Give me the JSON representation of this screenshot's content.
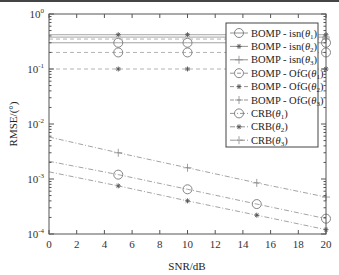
{
  "chart_data": {
    "type": "line",
    "title": "",
    "xlabel": "SNR/dB",
    "ylabel": "RMSE/(°)",
    "xlim": [
      0,
      20
    ],
    "ylim": [
      0.0001,
      1
    ],
    "yscale": "log",
    "grid": false,
    "legend_position": "upper right",
    "x_ticks": [
      0,
      2,
      4,
      6,
      8,
      10,
      12,
      14,
      16,
      18,
      20
    ],
    "y_ticks": [
      "10^0",
      "10^-1",
      "10^-2",
      "10^-3",
      "10^-4"
    ],
    "x": [
      0,
      5,
      10,
      15,
      20
    ],
    "series": [
      {
        "name": "BOMP - isn(θ1)",
        "marker": "circle",
        "linestyle": "solid",
        "values": [
          0.3,
          0.3,
          0.3,
          0.3,
          0.3
        ],
        "marker_x": [
          5,
          10,
          20
        ]
      },
      {
        "name": "BOMP - isn(θ2)",
        "marker": "star",
        "linestyle": "solid",
        "values": [
          0.42,
          0.42,
          0.42,
          0.42,
          0.42
        ],
        "marker_x": [
          5,
          10,
          20
        ]
      },
      {
        "name": "BOMP - isn(θ3)",
        "marker": "plus",
        "linestyle": "solid",
        "values": [
          0.38,
          0.38,
          0.38,
          0.38,
          0.38
        ],
        "marker_x": [
          20
        ]
      },
      {
        "name": "BOMP - OfG(θ1)",
        "marker": "circle",
        "linestyle": "dashed",
        "values": [
          0.2,
          0.2,
          0.2,
          0.2,
          0.2
        ],
        "marker_x": [
          5,
          10,
          20
        ]
      },
      {
        "name": "BOMP - OfG(θ2)",
        "marker": "star",
        "linestyle": "dashed",
        "values": [
          0.1,
          0.1,
          0.1,
          0.1,
          0.1
        ],
        "marker_x": [
          5,
          10,
          20
        ]
      },
      {
        "name": "BOMP - OfG(θ3)",
        "marker": "plus",
        "linestyle": "dashed",
        "values": [
          0.35,
          0.35,
          0.35,
          0.35,
          0.35
        ],
        "marker_x": [
          20
        ]
      },
      {
        "name": "CRB(θ1)",
        "marker": "circle",
        "linestyle": "dashdot",
        "values": [
          0.0021,
          0.0012,
          0.00065,
          0.00035,
          0.00019
        ]
      },
      {
        "name": "CRB(θ2)",
        "marker": "star",
        "linestyle": "dashdot",
        "values": [
          0.00135,
          0.00075,
          0.0004,
          0.00022,
          0.00012
        ]
      },
      {
        "name": "CRB(θ3)",
        "marker": "plus",
        "linestyle": "dashdot",
        "values": [
          0.0058,
          0.003,
          0.0016,
          0.00085,
          0.00047
        ]
      }
    ]
  },
  "legend": {
    "items": [
      {
        "label_main": "BOMP - isn(",
        "sym": "θ",
        "sub": "1",
        "end": ")"
      },
      {
        "label_main": "BOMP - isn(",
        "sym": "θ",
        "sub": "2",
        "end": ")"
      },
      {
        "label_main": "BOMP - isn(",
        "sym": "θ",
        "sub": "3",
        "end": ")"
      },
      {
        "label_main": "BOMP - OfG(",
        "sym": "θ",
        "sub": "1",
        "end": ")"
      },
      {
        "label_main": "BOMP - OfG(",
        "sym": "θ",
        "sub": "2",
        "end": ")"
      },
      {
        "label_main": "BOMP - OfG(",
        "sym": "θ",
        "sub": "3",
        "end": ")"
      },
      {
        "label_main": "CRB(",
        "sym": "θ",
        "sub": "1",
        "end": ")"
      },
      {
        "label_main": "CRB(",
        "sym": "θ",
        "sub": "2",
        "end": ")"
      },
      {
        "label_main": "CRB(",
        "sym": "θ",
        "sub": "3",
        "end": ")"
      }
    ]
  },
  "axes": {
    "xlabel": "SNR/dB",
    "ylabel": "RMSE/(°)",
    "x_tick_labels": [
      "0",
      "2",
      "4",
      "6",
      "8",
      "10",
      "12",
      "14",
      "16",
      "18",
      "20"
    ],
    "y_tick_exponents": [
      "0",
      "-1",
      "-2",
      "-3",
      "-4"
    ]
  },
  "colors": {
    "axis": "#555555",
    "line": "#888888",
    "marker": "#777777",
    "text": "#222222"
  }
}
